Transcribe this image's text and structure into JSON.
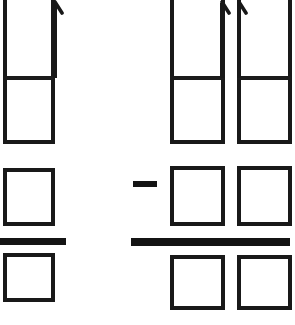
{
  "figure": {
    "background_color": "#ffffff",
    "ink_color": "#1a1a1a",
    "canvas": {
      "width": 295,
      "height": 325
    }
  },
  "groups": [
    {
      "id": "left-group",
      "label": "Left expression group",
      "columns": [
        {
          "id": "left-column-1",
          "label": "Left column",
          "arrow": {
            "name": "up-arrow",
            "direction": "up",
            "x": 55,
            "top_y": 2,
            "bottom_y": 30
          },
          "boxes": [
            {
              "id": "left-col1-box-top",
              "label": "blank box",
              "value": "",
              "x": 3,
              "y": -14,
              "width": 52,
              "height": 92
            },
            {
              "id": "left-col1-box-second",
              "label": "blank box",
              "value": "",
              "x": 3,
              "y": 78,
              "width": 52,
              "height": 65
            },
            {
              "id": "left-col1-box-third",
              "label": "blank box",
              "value": "",
              "x": 3,
              "y": 168,
              "width": 52,
              "height": 58
            },
            {
              "id": "left-col1-box-fourth",
              "label": "blank box",
              "value": "",
              "x": 3,
              "y": 253,
              "width": 52,
              "height": 47
            }
          ],
          "inner_divider": {
            "y": 78,
            "x1": 3,
            "x2": 55
          },
          "fraction_bar": {
            "id": "left-fraction-bar",
            "label": "fraction bar",
            "x": 0,
            "y": 238,
            "width": 66,
            "height": 7
          }
        }
      ]
    },
    {
      "id": "operator-minus",
      "label": "minus sign",
      "symbol": "−",
      "x": 133,
      "y": 181,
      "width": 24,
      "height": 6
    },
    {
      "id": "right-group",
      "label": "Right expression group",
      "fraction_bar": {
        "id": "right-fraction-bar",
        "label": "fraction bar",
        "x": 131,
        "y": 238,
        "width": 159,
        "height": 8
      },
      "columns": [
        {
          "id": "right-column-1",
          "label": "First right column",
          "arrow": {
            "name": "up-arrow",
            "direction": "up",
            "x": 223,
            "top_y": 2,
            "bottom_y": 30
          },
          "boxes": [
            {
              "id": "right-col1-box-top",
              "label": "blank box",
              "value": "",
              "x": 170,
              "y": -14,
              "width": 55,
              "height": 92
            },
            {
              "id": "right-col1-box-second",
              "label": "blank box",
              "value": "",
              "x": 170,
              "y": 78,
              "width": 55,
              "height": 65
            },
            {
              "id": "right-col1-box-third",
              "label": "blank box",
              "value": "",
              "x": 170,
              "y": 166,
              "width": 55,
              "height": 60
            },
            {
              "id": "right-col1-box-fourth",
              "label": "blank box",
              "value": "",
              "x": 170,
              "y": 255,
              "width": 55,
              "height": 55
            }
          ],
          "inner_divider": {
            "y": 78,
            "x1": 170,
            "x2": 225
          }
        },
        {
          "id": "right-column-2",
          "label": "Second right column",
          "arrow": {
            "name": "up-arrow",
            "direction": "up",
            "x": 239,
            "top_y": 2,
            "bottom_y": 30
          },
          "boxes": [
            {
              "id": "right-col2-box-top",
              "label": "blank box",
              "value": "",
              "x": 237,
              "y": -14,
              "width": 53,
              "height": 92
            },
            {
              "id": "right-col2-box-second",
              "label": "blank box",
              "value": "",
              "x": 237,
              "y": 78,
              "width": 53,
              "height": 65
            },
            {
              "id": "right-col2-box-third",
              "label": "blank box",
              "value": "",
              "x": 237,
              "y": 166,
              "width": 53,
              "height": 60
            },
            {
              "id": "right-col2-box-fourth",
              "label": "blank box",
              "value": "",
              "x": 237,
              "y": 255,
              "width": 53,
              "height": 55
            }
          ],
          "inner_divider": {
            "y": 78,
            "x1": 237,
            "x2": 290
          }
        }
      ]
    }
  ]
}
